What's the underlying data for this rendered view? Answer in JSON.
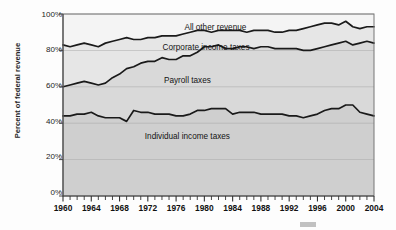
{
  "chart_data": {
    "type": "area",
    "title": "",
    "subtitle": "",
    "xlabel": "",
    "ylabel": "Percent of federal revenue",
    "xlim": [
      1960,
      2004
    ],
    "ylim": [
      0,
      100
    ],
    "grid": true,
    "legend_position": "inline-annotations",
    "y_ticks": [
      "0%",
      "20%",
      "40%",
      "60%",
      "80%",
      "100%"
    ],
    "y_tick_values": [
      0,
      20,
      40,
      60,
      80,
      100
    ],
    "x_ticks": [
      "1960",
      "1964",
      "1968",
      "1972",
      "1976",
      "1980",
      "1984",
      "1988",
      "1992",
      "1996",
      "2000",
      "2004"
    ],
    "x_tick_values": [
      1960,
      1964,
      1968,
      1972,
      1976,
      1980,
      1984,
      1988,
      1992,
      1996,
      2000,
      2004
    ],
    "minor_x_tick_interval": 1,
    "stacked": true,
    "x": [
      1960,
      1961,
      1962,
      1963,
      1964,
      1965,
      1966,
      1967,
      1968,
      1969,
      1970,
      1971,
      1972,
      1973,
      1974,
      1975,
      1976,
      1977,
      1978,
      1979,
      1980,
      1981,
      1982,
      1983,
      1984,
      1985,
      1986,
      1987,
      1988,
      1989,
      1990,
      1991,
      1992,
      1993,
      1994,
      1995,
      1996,
      1997,
      1998,
      1999,
      2000,
      2001,
      2002,
      2003,
      2004
    ],
    "series": [
      {
        "name": "Individual income taxes",
        "cumulative_values": [
          44,
          44,
          45,
          45,
          46,
          44,
          43,
          43,
          43,
          41,
          47,
          46,
          46,
          45,
          45,
          45,
          44,
          44,
          45,
          47,
          47,
          48,
          48,
          48,
          45,
          46,
          46,
          46,
          45,
          45,
          45,
          45,
          44,
          44,
          43,
          44,
          45,
          47,
          48,
          48,
          50,
          50,
          46,
          45,
          44
        ]
      },
      {
        "name": "Payroll taxes",
        "cumulative_values": [
          60,
          61,
          62,
          63,
          62,
          61,
          62,
          65,
          67,
          70,
          71,
          73,
          74,
          74,
          76,
          75,
          75,
          77,
          77,
          79,
          82,
          82,
          83,
          81,
          81,
          82,
          82,
          81,
          82,
          82,
          81,
          81,
          81,
          81,
          80,
          80,
          81,
          82,
          83,
          84,
          85,
          83,
          84,
          85,
          84
        ]
      },
      {
        "name": "Corporate income taxes",
        "cumulative_values": [
          83,
          82,
          83,
          84,
          83,
          82,
          84,
          85,
          86,
          87,
          86,
          86,
          87,
          87,
          88,
          88,
          88,
          89,
          90,
          91,
          91,
          90,
          91,
          91,
          91,
          91,
          90,
          91,
          91,
          91,
          90,
          90,
          91,
          91,
          92,
          93,
          94,
          95,
          95,
          94,
          96,
          93,
          92,
          93,
          93
        ]
      },
      {
        "name": "All other revenue",
        "cumulative_values": [
          100,
          100,
          100,
          100,
          100,
          100,
          100,
          100,
          100,
          100,
          100,
          100,
          100,
          100,
          100,
          100,
          100,
          100,
          100,
          100,
          100,
          100,
          100,
          100,
          100,
          100,
          100,
          100,
          100,
          100,
          100,
          100,
          100,
          100,
          100,
          100,
          100,
          100,
          100,
          100,
          100,
          100,
          100,
          100,
          100
        ]
      }
    ],
    "annotations": [
      {
        "text": "All other revenue",
        "x_pct": 49,
        "y_pct": 7
      },
      {
        "text": "Corporate income taxes",
        "x_pct": 46,
        "y_pct": 18
      },
      {
        "text": "Payroll taxes",
        "x_pct": 40,
        "y_pct": 36
      },
      {
        "text": "Individual income taxes",
        "x_pct": 40,
        "y_pct": 67
      }
    ],
    "colors": {
      "band_top": "#f4f4f4",
      "band_corporate": "#e6e6e6",
      "band_payroll": "#d9d9d9",
      "band_individual": "#cfcfcf",
      "line": "#1a1a1a",
      "grid": "#a8a8a8",
      "axis": "#555555",
      "background": "#fdfdfd"
    }
  },
  "axis": {
    "y_title": "Percent of federal revenue"
  }
}
